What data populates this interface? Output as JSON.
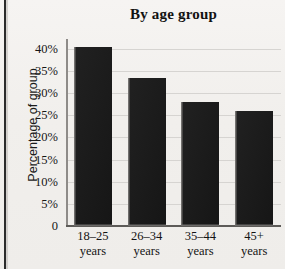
{
  "chart_data": {
    "type": "bar",
    "title": "By age group",
    "xlabel": "",
    "ylabel": "Percentage of group",
    "categories": [
      "18–25 years",
      "26–34 years",
      "35–44 years",
      "45+ years"
    ],
    "category_lines": [
      [
        "18–25",
        "years"
      ],
      [
        "26–34",
        "years"
      ],
      [
        "35–44",
        "years"
      ],
      [
        "45+",
        "years"
      ]
    ],
    "values": [
      40.5,
      33.5,
      28,
      26
    ],
    "ylim": [
      0,
      42
    ],
    "yticks": [
      0,
      5,
      10,
      15,
      20,
      25,
      30,
      35,
      40
    ],
    "ytick_labels": [
      "0",
      "5%",
      "10%",
      "15%",
      "20%",
      "25%",
      "30%",
      "35%",
      "40%"
    ],
    "grid": true,
    "legend": false,
    "bar_color": "#171717",
    "gridline_color": "#d6d4d1",
    "background_color": "#f4f2f0",
    "axis_color": "#5d5b58"
  }
}
